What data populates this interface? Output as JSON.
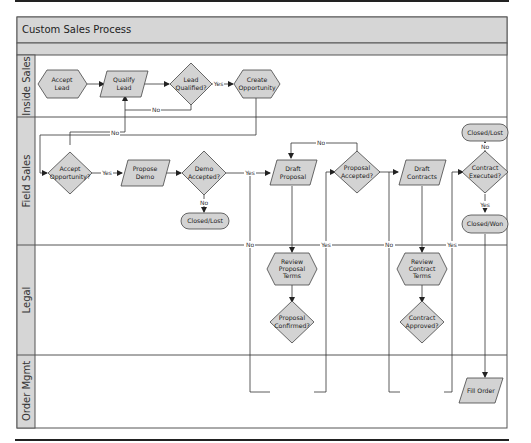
{
  "title": "Custom Sales Process",
  "lanes": [
    {
      "id": "inside-sales",
      "label": "Inside Sales"
    },
    {
      "id": "field-sales",
      "label": "Field Sales"
    },
    {
      "id": "legal",
      "label": "Legal"
    },
    {
      "id": "order-mgmt",
      "label": "Order Mgmt"
    }
  ],
  "nodes": {
    "accept_lead": {
      "line1": "Accept",
      "line2": "Lead",
      "shape": "hexagon"
    },
    "qualify_lead": {
      "line1": "Qualify",
      "line2": "Lead",
      "shape": "parallelogram"
    },
    "lead_qualified": {
      "line1": "Lead",
      "line2": "Qualified?",
      "shape": "diamond"
    },
    "create_opportunity": {
      "line1": "Create",
      "line2": "Opportunity",
      "shape": "hexagon"
    },
    "accept_opportunity": {
      "line1": "Accept",
      "line2": "Opportunity?",
      "shape": "diamond"
    },
    "propose_demo": {
      "line1": "Propose",
      "line2": "Demo",
      "shape": "parallelogram"
    },
    "demo_accepted": {
      "line1": "Demo",
      "line2": "Accepted?",
      "shape": "diamond"
    },
    "closed_lost_1": {
      "line1": "Closed/Lost",
      "shape": "terminator"
    },
    "draft_proposal": {
      "line1": "Draft",
      "line2": "Proposal",
      "shape": "parallelogram"
    },
    "proposal_accepted": {
      "line1": "Proposal",
      "line2": "Accepted?",
      "shape": "diamond"
    },
    "draft_contracts": {
      "line1": "Draft",
      "line2": "Contracts",
      "shape": "parallelogram"
    },
    "closed_lost_2": {
      "line1": "Closed/Lost",
      "shape": "terminator"
    },
    "contract_executed": {
      "line1": "Contract",
      "line2": "Executed?",
      "shape": "diamond"
    },
    "closed_won": {
      "line1": "Closed/Won",
      "shape": "terminator"
    },
    "review_proposal_terms": {
      "line1": "Review",
      "line2": "Proposal",
      "line3": "Terms",
      "shape": "hexagon"
    },
    "proposal_confirmed": {
      "line1": "Proposal",
      "line2": "Confirmed?",
      "shape": "diamond"
    },
    "review_contract_terms": {
      "line1": "Review",
      "line2": "Contract",
      "line3": "Terms",
      "shape": "hexagon"
    },
    "contract_approved": {
      "line1": "Contract",
      "line2": "Approved?",
      "shape": "diamond"
    },
    "fill_order": {
      "line1": "Fill Order",
      "shape": "parallelogram"
    }
  },
  "edge_labels": {
    "yes": "Yes",
    "no": "No"
  },
  "colors": {
    "shape_fill": "#d3d3d3",
    "header_fill": "#d6d6d6",
    "line": "#333333"
  }
}
